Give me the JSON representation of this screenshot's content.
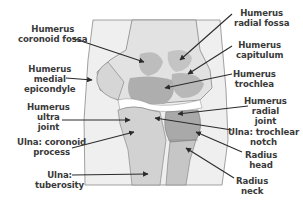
{
  "diagram": {
    "colors": {
      "background": "#ffffff",
      "frame": "#ededed",
      "bone_light": "#d2d2d2",
      "bone_mid": "#bdbdbd",
      "bone_dark": "#a9a9a9",
      "outline": "#6a6a6a",
      "text": "#3a3a3a",
      "arrow": "#2b2b2b"
    },
    "labels": [
      {
        "id": "humerus-coronoid-fossa",
        "text": "Humerus\ncoronoid fossa"
      },
      {
        "id": "humerus-medial-epicondyle",
        "text": "Humerus\nmedial\nepicondyle"
      },
      {
        "id": "humerus-ultra-joint",
        "text": "Humerus\nultra\njoint"
      },
      {
        "id": "ulna-coronoid-process",
        "text": "Ulna: coronoid\nprocess"
      },
      {
        "id": "ulna-tuberosity",
        "text": "Ulna:\ntuberosity"
      },
      {
        "id": "humerus-radial-fossa",
        "text": "Humerus\nradial fossa"
      },
      {
        "id": "humerus-capitulum",
        "text": "Humerus\ncapitulum"
      },
      {
        "id": "humerus-trochlea",
        "text": "Humerus\ntrochlea"
      },
      {
        "id": "humerus-radial-joint",
        "text": "Humerus\nradial\njoint"
      },
      {
        "id": "ulna-trochlear-notch",
        "text": "Ulna: trochlear\nnotch"
      },
      {
        "id": "radius-head",
        "text": "Radius\nhead"
      },
      {
        "id": "radius-neck",
        "text": "Radius\nneck"
      }
    ]
  }
}
